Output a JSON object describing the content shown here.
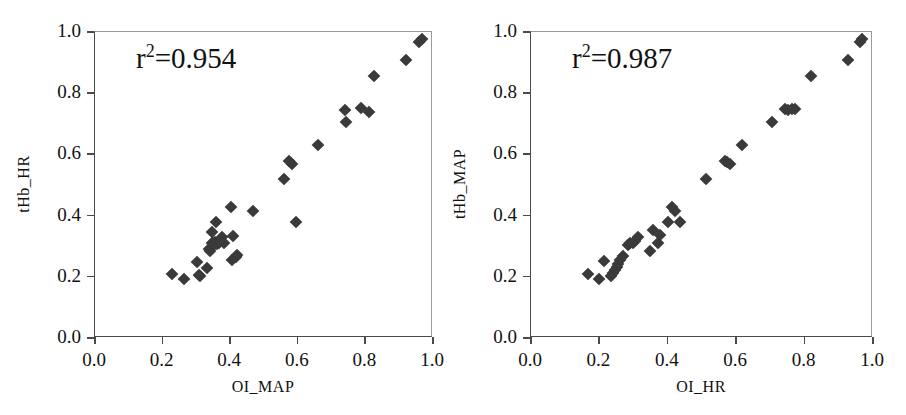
{
  "figure": {
    "background": "#ffffff",
    "marker_color": "#3a3a3a",
    "axis_color": "#4a4a4a"
  },
  "chart_data": [
    {
      "type": "scatter",
      "title": "",
      "panel": "left",
      "xlabel": "OI_MAP",
      "ylabel": "tHb_HR",
      "xlim": [
        0.0,
        1.0
      ],
      "ylim": [
        0.0,
        1.0
      ],
      "xticks": [
        "0.0",
        "0.2",
        "0.4",
        "0.6",
        "0.8",
        "1.0"
      ],
      "yticks": [
        "0.0",
        "0.2",
        "0.4",
        "0.6",
        "0.8",
        "1.0"
      ],
      "xtick_values": [
        0.0,
        0.2,
        0.4,
        0.6,
        0.8,
        1.0
      ],
      "ytick_values": [
        0.0,
        0.2,
        0.4,
        0.6,
        0.8,
        1.0
      ],
      "grid": false,
      "legend": "none",
      "annotation": "r²=0.954",
      "annotation_base": "r",
      "annotation_sup": "2",
      "annotation_rest": "=0.954",
      "marker_shape": "diamond",
      "points": [
        [
          0.228,
          0.208
        ],
        [
          0.262,
          0.192
        ],
        [
          0.303,
          0.25
        ],
        [
          0.307,
          0.205
        ],
        [
          0.312,
          0.203
        ],
        [
          0.33,
          0.228
        ],
        [
          0.336,
          0.29
        ],
        [
          0.341,
          0.283
        ],
        [
          0.346,
          0.312
        ],
        [
          0.347,
          0.345
        ],
        [
          0.35,
          0.31
        ],
        [
          0.353,
          0.305
        ],
        [
          0.356,
          0.315
        ],
        [
          0.358,
          0.38
        ],
        [
          0.362,
          0.308
        ],
        [
          0.366,
          0.312
        ],
        [
          0.377,
          0.33
        ],
        [
          0.382,
          0.312
        ],
        [
          0.402,
          0.428
        ],
        [
          0.406,
          0.255
        ],
        [
          0.408,
          0.333
        ],
        [
          0.416,
          0.265
        ],
        [
          0.419,
          0.27
        ],
        [
          0.466,
          0.415
        ],
        [
          0.56,
          0.518
        ],
        [
          0.573,
          0.578
        ],
        [
          0.584,
          0.57
        ],
        [
          0.596,
          0.378
        ],
        [
          0.66,
          0.63
        ],
        [
          0.739,
          0.745
        ],
        [
          0.743,
          0.707
        ],
        [
          0.787,
          0.752
        ],
        [
          0.81,
          0.74
        ],
        [
          0.826,
          0.855
        ],
        [
          0.92,
          0.908
        ],
        [
          0.96,
          0.968
        ],
        [
          0.968,
          0.978
        ]
      ]
    },
    {
      "type": "scatter",
      "title": "",
      "panel": "right",
      "xlabel": "OI_HR",
      "ylabel": "tHb_MAP",
      "xlim": [
        0.0,
        1.0
      ],
      "ylim": [
        0.0,
        1.0
      ],
      "xticks": [
        "0.0",
        "0.2",
        "0.4",
        "0.6",
        "0.8",
        "1.0"
      ],
      "yticks": [
        "0.0",
        "0.2",
        "0.4",
        "0.6",
        "0.8",
        "1.0"
      ],
      "xtick_values": [
        0.0,
        0.2,
        0.4,
        0.6,
        0.8,
        1.0
      ],
      "ytick_values": [
        0.0,
        0.2,
        0.4,
        0.6,
        0.8,
        1.0
      ],
      "grid": false,
      "legend": "none",
      "annotation": "r²=0.987",
      "annotation_base": "r",
      "annotation_sup": "2",
      "annotation_rest": "=0.987",
      "marker_shape": "diamond",
      "points": [
        [
          0.168,
          0.208
        ],
        [
          0.198,
          0.192
        ],
        [
          0.214,
          0.252
        ],
        [
          0.234,
          0.203
        ],
        [
          0.24,
          0.212
        ],
        [
          0.245,
          0.222
        ],
        [
          0.25,
          0.233
        ],
        [
          0.254,
          0.243
        ],
        [
          0.261,
          0.254
        ],
        [
          0.268,
          0.268
        ],
        [
          0.283,
          0.305
        ],
        [
          0.29,
          0.31
        ],
        [
          0.298,
          0.312
        ],
        [
          0.305,
          0.318
        ],
        [
          0.312,
          0.33
        ],
        [
          0.348,
          0.283
        ],
        [
          0.356,
          0.352
        ],
        [
          0.372,
          0.312
        ],
        [
          0.378,
          0.338
        ],
        [
          0.4,
          0.378
        ],
        [
          0.413,
          0.428
        ],
        [
          0.422,
          0.415
        ],
        [
          0.437,
          0.378
        ],
        [
          0.513,
          0.518
        ],
        [
          0.566,
          0.58
        ],
        [
          0.573,
          0.575
        ],
        [
          0.583,
          0.568
        ],
        [
          0.617,
          0.63
        ],
        [
          0.705,
          0.707
        ],
        [
          0.744,
          0.748
        ],
        [
          0.752,
          0.745
        ],
        [
          0.763,
          0.75
        ],
        [
          0.771,
          0.748
        ],
        [
          0.818,
          0.855
        ],
        [
          0.928,
          0.908
        ],
        [
          0.962,
          0.968
        ],
        [
          0.968,
          0.978
        ]
      ]
    }
  ]
}
